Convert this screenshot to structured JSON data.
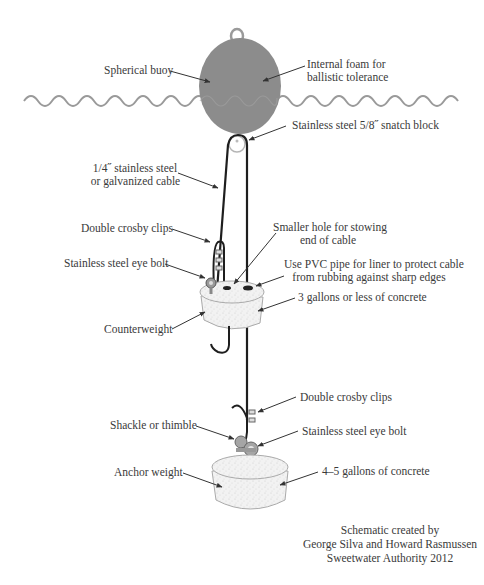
{
  "diagram": {
    "colors": {
      "water_line": "#9a9a9a",
      "buoy_fill": "#8c8c8c",
      "cable": "#1e1e1e",
      "concrete": "#efefef",
      "label_text": "#3a3a3a",
      "arrow": "#333333"
    },
    "labels": {
      "spherical_buoy": "Spherical buoy",
      "internal_foam_line1": "Internal foam for",
      "internal_foam_line2": "ballistic tolerance",
      "snatch_block": "Stainless steel 5/8˝ snatch block",
      "cable_line1": "1/4˝ stainless steel",
      "cable_line2": "or galvanized cable",
      "crosby_clips_upper": "Double crosby clips",
      "smaller_hole_line1": "Smaller hole for stowing",
      "smaller_hole_line2": "end of cable",
      "eye_bolt_upper": "Stainless steel eye bolt",
      "pvc_line1": "Use PVC pipe for liner to protect cable",
      "pvc_line2": "from rubbing against sharp edges",
      "concrete_3gal": "3 gallons or less of concrete",
      "counterweight": "Counterweight",
      "crosby_clips_lower": "Double crosby clips",
      "shackle": "Shackle or thimble",
      "eye_bolt_lower": "Stainless steel eye bolt",
      "anchor_weight": "Anchor weight",
      "concrete_45gal": "4–5 gallons of concrete"
    },
    "credit": {
      "line1": "Schematic created by",
      "line2": "George Silva and Howard Rasmussen",
      "line3": "Sweetwater Authority 2012"
    }
  }
}
